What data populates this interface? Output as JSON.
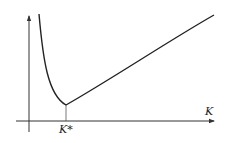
{
  "diagram": {
    "type": "cost-curve",
    "x_axis_label": "K",
    "minimum_label": "K*",
    "curve": {
      "description": "U-shaped convex curve: steep decline from the top-left to a minimum at K*, then roughly linear increase",
      "color": "#222222"
    },
    "axis_color": "#333333"
  }
}
